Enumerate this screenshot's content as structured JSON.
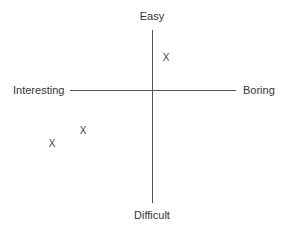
{
  "diagram": {
    "type": "quadrant",
    "axes": {
      "top": "Easy",
      "bottom": "Difficult",
      "left": "Interesting",
      "right": "Boring"
    },
    "marks": [
      {
        "symbol": "X",
        "x": 166,
        "y": 58,
        "quadrant": "easy-boring"
      },
      {
        "symbol": "X",
        "x": 83,
        "y": 131,
        "quadrant": "difficult-interesting"
      },
      {
        "symbol": "X",
        "x": 52,
        "y": 144,
        "quadrant": "difficult-interesting"
      }
    ]
  }
}
